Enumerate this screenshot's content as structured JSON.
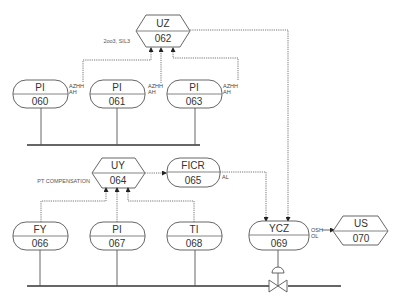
{
  "diagram": {
    "type": "P&ID instrument loop diagram",
    "instruments": [
      {
        "id": "uz-062",
        "function": "UZ",
        "number": "062",
        "shape": "hexagon",
        "note": "2oo3, SIL3"
      },
      {
        "id": "pi-060",
        "function": "PI",
        "number": "060",
        "shape": "rounded",
        "alarms": [
          "AZHH",
          "AH"
        ]
      },
      {
        "id": "pi-061",
        "function": "PI",
        "number": "061",
        "shape": "rounded",
        "alarms": [
          "AZHH",
          "AH"
        ]
      },
      {
        "id": "pi-063",
        "function": "PI",
        "number": "063",
        "shape": "rounded",
        "alarms": [
          "AZHH",
          "AH"
        ]
      },
      {
        "id": "uy-064",
        "function": "UY",
        "number": "064",
        "shape": "hexagon",
        "note": "PT COMPENSATION"
      },
      {
        "id": "ficr-065",
        "function": "FICR",
        "number": "065",
        "shape": "rounded",
        "alarms": [
          "AL"
        ]
      },
      {
        "id": "fy-066",
        "function": "FY",
        "number": "066",
        "shape": "rounded"
      },
      {
        "id": "pi-067",
        "function": "PI",
        "number": "067",
        "shape": "rounded"
      },
      {
        "id": "ti-068",
        "function": "TI",
        "number": "068",
        "shape": "rounded"
      },
      {
        "id": "ycz-069",
        "function": "YCZ",
        "number": "069",
        "shape": "rounded",
        "alarms": [
          "OSH",
          "OL"
        ]
      },
      {
        "id": "us-070",
        "function": "US",
        "number": "070",
        "shape": "hexagon"
      }
    ],
    "connections": [
      {
        "from": "pi-060",
        "to": "uz-062",
        "style": "signal"
      },
      {
        "from": "pi-061",
        "to": "uz-062",
        "style": "signal"
      },
      {
        "from": "pi-063",
        "to": "uz-062",
        "style": "signal"
      },
      {
        "from": "uz-062",
        "to": "ycz-069",
        "style": "signal"
      },
      {
        "from": "fy-066",
        "to": "uy-064",
        "style": "signal"
      },
      {
        "from": "pi-067",
        "to": "uy-064",
        "style": "signal"
      },
      {
        "from": "ti-068",
        "to": "uy-064",
        "style": "signal"
      },
      {
        "from": "uy-064",
        "to": "ficr-065",
        "style": "signal"
      },
      {
        "from": "ficr-065",
        "to": "ycz-069",
        "style": "signal"
      },
      {
        "from": "ycz-069",
        "to": "us-070",
        "style": "signal"
      },
      {
        "from": "ycz-069",
        "to": "control-valve",
        "style": "process"
      }
    ]
  },
  "labels": {
    "uz": {
      "fn": "UZ",
      "num": "062",
      "note": "2oo3, SIL3"
    },
    "pi060": {
      "fn": "PI",
      "num": "060",
      "a1": "AZHH",
      "a2": "AH"
    },
    "pi061": {
      "fn": "PI",
      "num": "061",
      "a1": "AZHH",
      "a2": "AH"
    },
    "pi063": {
      "fn": "PI",
      "num": "063",
      "a1": "AZHH",
      "a2": "AH"
    },
    "uy": {
      "fn": "UY",
      "num": "064",
      "note": "PT COMPENSATION"
    },
    "ficr": {
      "fn": "FICR",
      "num": "065",
      "a1": "AL"
    },
    "fy": {
      "fn": "FY",
      "num": "066"
    },
    "pi067": {
      "fn": "PI",
      "num": "067"
    },
    "ti": {
      "fn": "TI",
      "num": "068"
    },
    "ycz": {
      "fn": "YCZ",
      "num": "069",
      "a1": "OSH",
      "a2": "OL"
    },
    "us": {
      "fn": "US",
      "num": "070"
    }
  }
}
